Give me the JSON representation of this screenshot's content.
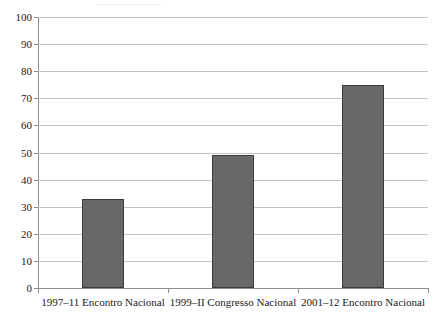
{
  "artifact": {
    "top_strip_text": "......................................."
  },
  "chart_data": {
    "type": "bar",
    "title": "",
    "subtitle": "",
    "xlabel": "",
    "ylabel": "",
    "ylim": [
      0,
      100
    ],
    "ytick_step": 10,
    "yticks": [
      0,
      10,
      20,
      30,
      40,
      50,
      60,
      70,
      80,
      90,
      100
    ],
    "ytick_labels": [
      "0",
      "10",
      "20",
      "30",
      "40",
      "50",
      "60",
      "70",
      "80",
      "90",
      "100"
    ],
    "categories": [
      "1997–11 Encontro Nacional",
      "1999–II Congresso Nacional",
      "2001–12 Encontro Nacional"
    ],
    "values": [
      33,
      49,
      75
    ],
    "grid": "horizontal",
    "legend": "none",
    "bar_color": "#686868",
    "bar_border_color": "#3b3b3b",
    "grid_color": "#c2c2c2",
    "axis_color": "#8d8d8d"
  }
}
